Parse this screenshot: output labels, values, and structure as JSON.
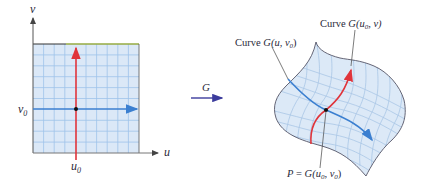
{
  "left_panel": {
    "axis_v_label": "v",
    "axis_u_label": "u",
    "u0_label": "u",
    "u0_sub": "0",
    "v0_label": "v",
    "v0_sub": "0",
    "fill_color": "#dbe8f7",
    "grid_color": "#9ec3ea",
    "top_edge_color": "#c8e84a",
    "horizontal_curve_color": "#3b7fd0",
    "vertical_curve_color": "#e0343b"
  },
  "mapping": {
    "label": "G",
    "arrow_color": "#3b3b9c"
  },
  "right_panel": {
    "curve_u_label_prefix": "Curve ",
    "curve_u_label_func": "G",
    "curve_u_label_args": "(u, v",
    "curve_u_label_sub": "0",
    "curve_u_label_close": ")",
    "curve_v_label_prefix": "Curve ",
    "curve_v_label_func": "G",
    "curve_v_label_args_open": "(u",
    "curve_v_label_sub": "0",
    "curve_v_label_args_close": ", v)",
    "point_label_P": "P",
    "point_label_eq": " = ",
    "point_label_func": "G",
    "point_label_open": "(u",
    "point_label_sub1": "0",
    "point_label_mid": ", v",
    "point_label_sub2": "0",
    "point_label_close": ")",
    "surface_fill": "#dce9f7",
    "surface_grid": "#a9c6e6",
    "surface_edge": "#555566"
  }
}
